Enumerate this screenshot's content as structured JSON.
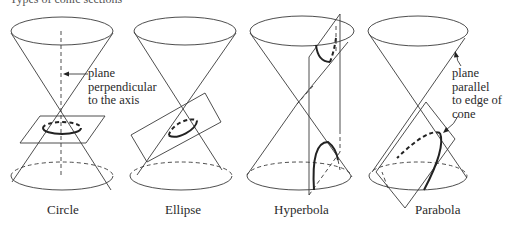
{
  "figure": {
    "title_clipped": "Types of conic sections",
    "panels": [
      {
        "id": "circle",
        "label": "Circle",
        "annotation": [
          "plane",
          "perpendicular",
          "to the axis"
        ]
      },
      {
        "id": "ellipse",
        "label": "Ellipse"
      },
      {
        "id": "hyperbola",
        "label": "Hyperbola"
      },
      {
        "id": "parabola",
        "label": "Parabola",
        "annotation": [
          "plane",
          "parallel",
          "to edge of",
          "cone"
        ]
      }
    ],
    "colors": {
      "line": "#3a3a3a",
      "curve": "#222222",
      "background": "#ffffff"
    }
  }
}
